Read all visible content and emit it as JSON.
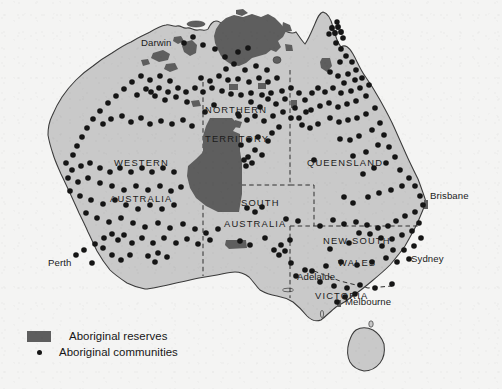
{
  "figure": {
    "kind": "thematic-map",
    "background_color": "#f4f4f3",
    "land_color": "#c9c9c9",
    "reserve_color": "#5e5e5e",
    "coastline_color": "#3a3a3a",
    "border_color": "#2e2e2e",
    "dot_color": "#151515"
  },
  "legend": {
    "items": [
      {
        "key": "reserves-swatch",
        "label": "Aboriginal reserves"
      },
      {
        "key": "communities-dot",
        "label": "Aboriginal communities"
      }
    ]
  },
  "state_labels": [
    {
      "name": "northern-territory-line1",
      "text": "NORTHERN",
      "x": 205,
      "y": 105
    },
    {
      "name": "northern-territory-line2",
      "text": "TERRITORY",
      "x": 205,
      "y": 134
    },
    {
      "name": "western-australia-line1",
      "text": "WESTERN",
      "x": 114,
      "y": 158
    },
    {
      "name": "western-australia-line2",
      "text": "AUSTRALIA",
      "x": 110,
      "y": 194
    },
    {
      "name": "south-australia-line1",
      "text": "SOUTH",
      "x": 241,
      "y": 198
    },
    {
      "name": "south-australia-line2",
      "text": "AUSTRALIA",
      "x": 224,
      "y": 219
    },
    {
      "name": "queensland",
      "text": "QUEENSLAND",
      "x": 307,
      "y": 158
    },
    {
      "name": "new-south-wales-line1",
      "text": "NEW  SOUTH",
      "x": 323,
      "y": 236
    },
    {
      "name": "new-south-wales-line2",
      "text": "WALES",
      "x": 338,
      "y": 258
    },
    {
      "name": "victoria",
      "text": "VICTORIA",
      "x": 315,
      "y": 291
    }
  ],
  "city_labels": [
    {
      "name": "darwin",
      "text": "Darwin",
      "x": 173,
      "y": 43,
      "anchor": "right"
    },
    {
      "name": "brisbane",
      "text": "Brisbane",
      "x": 430,
      "y": 196,
      "anchor": "left"
    },
    {
      "name": "sydney",
      "text": "Sydney",
      "x": 411,
      "y": 259,
      "anchor": "left"
    },
    {
      "name": "adelaide",
      "text": "Adelaide",
      "x": 297,
      "y": 277,
      "anchor": "left"
    },
    {
      "name": "melbourne",
      "text": "Melbourne",
      "x": 345,
      "y": 302,
      "anchor": "left"
    },
    {
      "name": "perth",
      "text": "Perth",
      "x": 75,
      "y": 263,
      "anchor": "right"
    }
  ],
  "map_geometry": {
    "mainland_outline": "M 166,25 L 172,29 L 177,27 L 181,32 L 186,29 L 190,34 L 196,30 L 200,34 L 206,31 L 208,26 L 213,22 L 219,25 L 223,21 L 228,25 L 234,22 L 239,26 L 245,23 L 252,27 L 258,24 L 264,29 L 270,26 L 276,31 L 281,28 L 287,33 L 292,37 L 297,34 L 300,39 L 304,45 L 309,41 L 313,36 L 317,30 L 320,23 L 322,17 L 326,13 L 331,18 L 334,25 L 336,33 L 338,41 L 342,48 L 347,44 L 351,49 L 355,56 L 359,63 L 362,71 L 367,78 L 372,85 L 377,93 L 382,101 L 387,110 L 392,119 L 396,128 L 400,137 L 404,146 L 408,155 L 412,164 L 416,172 L 420,180 L 423,188 L 426,196 L 428,203 L 425,210 L 422,217 L 419,224 L 416,231 L 412,238 L 408,244 L 404,250 L 399,256 L 394,262 L 389,267 L 383,272 L 377,277 L 371,282 L 365,287 L 359,292 L 353,296 L 347,300 L 341,304 L 336,307 L 331,310 L 327,314 L 323,318 L 319,321 L 314,322 L 309,320 L 305,316 L 301,312 L 297,308 L 293,304 L 288,301 L 283,299 L 278,298 L 273,297 L 268,296 L 263,294 L 259,291 L 256,287 L 253,283 L 250,279 L 247,276 L 243,274 L 239,273 L 234,273 L 229,274 L 224,275 L 219,276 L 214,277 L 209,278 L 204,279 L 199,280 L 194,281 L 189,282 L 184,283 L 179,284 L 174,285 L 169,286 L 164,287 L 159,288 L 154,289 L 149,290 L 144,290 L 139,289 L 134,287 L 129,285 L 124,282 L 119,278 L 114,274 L 110,269 L 106,264 L 102,259 L 99,253 L 96,247 L 93,241 L 90,235 L 87,229 L 84,223 L 81,217 L 78,211 L 75,205 L 72,199 L 69,193 L 66,187 L 63,181 L 60,175 L 57,169 L 55,163 L 53,157 L 51,151 L 50,145 L 49,139 L 49,133 L 50,127 L 52,121 L 55,115 L 58,109 L 62,103 L 66,97 L 70,91 L 75,86 L 80,81 L 85,76 L 90,71 L 96,67 L 102,63 L 108,59 L 114,55 L 120,51 L 126,47 L 132,43 L 138,40 L 144,37 L 150,34 L 156,31 L 161,28 Z",
    "tasmania_outline": "M 356,330 L 362,327 L 369,328 L 375,331 L 380,336 L 383,342 L 384,349 L 383,356 L 380,362 L 375,367 L 369,370 L 363,371 L 357,369 L 353,365 L 350,360 L 348,354 L 348,347 L 350,340 L 353,334 Z"
  }
}
